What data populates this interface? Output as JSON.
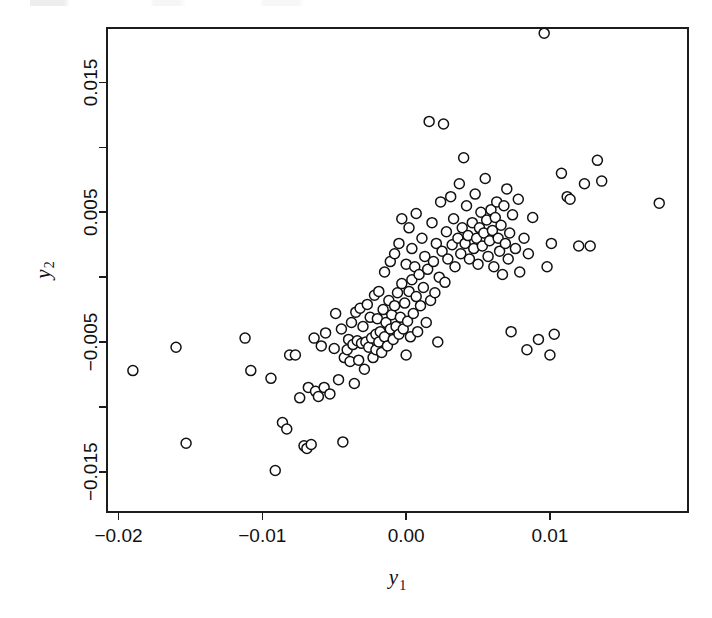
{
  "figure": {
    "background": "#ffffff",
    "ink_color": "#111111",
    "marker": {
      "shape": "open-circle",
      "radius_px": 5.0,
      "stroke": "#111111",
      "fill": "#ffffff",
      "stroke_width": 1.5
    },
    "plot_box": {
      "left": 107,
      "top": 28,
      "right": 688,
      "bottom": 512
    }
  },
  "chart_data": {
    "type": "scatter",
    "title": "",
    "xlabel": "y1",
    "ylabel": "y2",
    "xlabel_base": "y",
    "xlabel_sub": "1",
    "ylabel_base": "y",
    "ylabel_sub": "2",
    "grid": false,
    "legend": null,
    "box_frame": true,
    "xlim": [
      -0.0208,
      0.0196
    ],
    "ylim": [
      -0.0181,
      0.0192
    ],
    "xticks": [
      -0.02,
      -0.01,
      0.0,
      0.01
    ],
    "xticklabels": [
      "-0.02",
      "-0.01",
      "0.00",
      "0.01"
    ],
    "xminorticks": [],
    "yticks": [
      0.015,
      0.01,
      0.005,
      0.0,
      -0.005,
      -0.01,
      -0.015
    ],
    "yticklabels": [
      "0.015",
      "",
      "0.005",
      "",
      "-0.005",
      "",
      "-0.015"
    ],
    "ytick_labeled": [
      0.015,
      0.005,
      -0.005,
      -0.015
    ],
    "n_points": 136,
    "correlation_note": "positive association, dense diagonal cluster near origin",
    "points": [
      [
        -0.019,
        -0.0072
      ],
      [
        -0.016,
        -0.0054
      ],
      [
        -0.0153,
        -0.0128
      ],
      [
        -0.0112,
        -0.0047
      ],
      [
        -0.0108,
        -0.0072
      ],
      [
        -0.0094,
        -0.0078
      ],
      [
        -0.0091,
        -0.0149
      ],
      [
        -0.0086,
        -0.0112
      ],
      [
        -0.0083,
        -0.0117
      ],
      [
        -0.0081,
        -0.006
      ],
      [
        -0.0077,
        -0.006
      ],
      [
        -0.0074,
        -0.0093
      ],
      [
        -0.0071,
        -0.013
      ],
      [
        -0.0069,
        -0.0132
      ],
      [
        -0.0068,
        -0.0085
      ],
      [
        -0.0066,
        -0.0129
      ],
      [
        -0.0064,
        -0.0047
      ],
      [
        -0.0063,
        -0.0088
      ],
      [
        -0.0061,
        -0.0092
      ],
      [
        -0.0059,
        -0.0053
      ],
      [
        -0.0057,
        -0.0085
      ],
      [
        -0.0056,
        -0.0043
      ],
      [
        -0.0053,
        -0.009
      ],
      [
        -0.005,
        -0.0055
      ],
      [
        -0.0049,
        -0.0028
      ],
      [
        -0.0047,
        -0.0079
      ],
      [
        -0.0045,
        -0.004
      ],
      [
        -0.0044,
        -0.0127
      ],
      [
        -0.0043,
        -0.0062
      ],
      [
        -0.0041,
        -0.0056
      ],
      [
        -0.004,
        -0.0048
      ],
      [
        -0.0039,
        -0.0065
      ],
      [
        -0.0038,
        -0.0035
      ],
      [
        -0.0037,
        -0.0052
      ],
      [
        -0.0036,
        -0.0082
      ],
      [
        -0.0035,
        -0.0027
      ],
      [
        -0.0034,
        -0.0049
      ],
      [
        -0.0033,
        -0.0064
      ],
      [
        -0.0032,
        -0.0024
      ],
      [
        -0.0031,
        -0.0051
      ],
      [
        -0.003,
        -0.0038
      ],
      [
        -0.0029,
        -0.0071
      ],
      [
        -0.0028,
        -0.005
      ],
      [
        -0.0027,
        -0.0021
      ],
      [
        -0.0026,
        -0.0054
      ],
      [
        -0.0025,
        -0.0031
      ],
      [
        -0.0024,
        -0.0047
      ],
      [
        -0.0023,
        -0.0062
      ],
      [
        -0.0022,
        -0.0014
      ],
      [
        -0.0021,
        -0.0044
      ],
      [
        -0.0021,
        -0.0056
      ],
      [
        -0.002,
        -0.0032
      ],
      [
        -0.0019,
        -0.005
      ],
      [
        -0.0019,
        -0.0011
      ],
      [
        -0.0018,
        -0.0042
      ],
      [
        -0.0017,
        -0.0058
      ],
      [
        -0.0016,
        -0.0025
      ],
      [
        -0.0015,
        -0.0046
      ],
      [
        -0.0015,
        0.0004
      ],
      [
        -0.0014,
        -0.0035
      ],
      [
        -0.0013,
        -0.0053
      ],
      [
        -0.0012,
        -0.0018
      ],
      [
        -0.0011,
        -0.004
      ],
      [
        -0.0011,
        0.0012
      ],
      [
        -0.001,
        -0.0029
      ],
      [
        -0.0009,
        -0.0048
      ],
      [
        -0.0008,
        -0.0022
      ],
      [
        -0.0008,
        0.0018
      ],
      [
        -0.0007,
        -0.0038
      ],
      [
        -0.0006,
        -0.0012
      ],
      [
        -0.0005,
        -0.0044
      ],
      [
        -0.0005,
        0.0026
      ],
      [
        -0.0004,
        -0.0031
      ],
      [
        -0.0003,
        -0.0005
      ],
      [
        -0.0003,
        0.0045
      ],
      [
        -0.0002,
        -0.004
      ],
      [
        -0.0001,
        -0.002
      ],
      [
        0.0,
        -0.006
      ],
      [
        0.0,
        0.001
      ],
      [
        0.0001,
        -0.0034
      ],
      [
        0.0002,
        -0.0011
      ],
      [
        0.0002,
        0.0038
      ],
      [
        0.0003,
        -0.0046
      ],
      [
        0.0004,
        -0.0002
      ],
      [
        0.0004,
        0.0022
      ],
      [
        0.0005,
        -0.0028
      ],
      [
        0.0006,
        0.0008
      ],
      [
        0.0007,
        -0.0015
      ],
      [
        0.0007,
        0.0049
      ],
      [
        0.0008,
        -0.0042
      ],
      [
        0.0009,
        0.0002
      ],
      [
        0.001,
        -0.0022
      ],
      [
        0.0011,
        0.003
      ],
      [
        0.0012,
        -0.0008
      ],
      [
        0.0013,
        0.0016
      ],
      [
        0.0014,
        -0.0035
      ],
      [
        0.0015,
        0.0006
      ],
      [
        0.0016,
        0.012
      ],
      [
        0.0017,
        -0.0018
      ],
      [
        0.0018,
        0.0042
      ],
      [
        0.0019,
        0.0012
      ],
      [
        0.002,
        -0.0012
      ],
      [
        0.0021,
        0.0026
      ],
      [
        0.0022,
        -0.005
      ],
      [
        0.0023,
        0.0
      ],
      [
        0.0024,
        0.0058
      ],
      [
        0.0025,
        0.002
      ],
      [
        0.0026,
        0.0118
      ],
      [
        0.0027,
        -0.0004
      ],
      [
        0.0028,
        0.0035
      ],
      [
        0.0029,
        0.0014
      ],
      [
        0.0031,
        0.0062
      ],
      [
        0.0032,
        0.0025
      ],
      [
        0.0033,
        0.0045
      ],
      [
        0.0034,
        0.0008
      ],
      [
        0.0036,
        0.003
      ],
      [
        0.0037,
        0.0072
      ],
      [
        0.0038,
        0.0018
      ],
      [
        0.0039,
        0.0038
      ],
      [
        0.004,
        0.0092
      ],
      [
        0.0041,
        0.0026
      ],
      [
        0.0042,
        0.0055
      ],
      [
        0.0043,
        0.0032
      ],
      [
        0.0044,
        0.0014
      ],
      [
        0.0046,
        0.0042
      ],
      [
        0.0047,
        0.0022
      ],
      [
        0.0048,
        0.0064
      ],
      [
        0.0049,
        0.003
      ],
      [
        0.005,
        0.001
      ],
      [
        0.0051,
        0.0038
      ],
      [
        0.0052,
        0.005
      ],
      [
        0.0053,
        0.0024
      ],
      [
        0.0054,
        0.0034
      ],
      [
        0.0055,
        0.0076
      ],
      [
        0.0056,
        0.0044
      ],
      [
        0.0057,
        0.0016
      ],
      [
        0.0058,
        0.0028
      ],
      [
        0.0059,
        0.0052
      ],
      [
        0.006,
        0.0036
      ],
      [
        0.0061,
        0.0008
      ],
      [
        0.0062,
        0.0046
      ],
      [
        0.0063,
        0.0058
      ],
      [
        0.0064,
        0.003
      ],
      [
        0.0065,
        0.002
      ],
      [
        0.0066,
        0.004
      ],
      [
        0.0067,
        0.0002
      ],
      [
        0.0068,
        0.0055
      ],
      [
        0.0069,
        0.0026
      ],
      [
        0.007,
        0.0068
      ],
      [
        0.0071,
        0.0014
      ],
      [
        0.0072,
        0.0034
      ],
      [
        0.0073,
        -0.0042
      ],
      [
        0.0074,
        0.0048
      ],
      [
        0.0076,
        0.0022
      ],
      [
        0.0078,
        0.006
      ],
      [
        0.0079,
        0.0004
      ],
      [
        0.0082,
        0.003
      ],
      [
        0.0084,
        -0.0056
      ],
      [
        0.0085,
        0.0018
      ],
      [
        0.0088,
        0.0046
      ],
      [
        0.0092,
        -0.0048
      ],
      [
        0.0096,
        0.0188
      ],
      [
        0.0098,
        0.0008
      ],
      [
        0.01,
        -0.006
      ],
      [
        0.0101,
        0.0026
      ],
      [
        0.0103,
        -0.0044
      ],
      [
        0.0108,
        0.008
      ],
      [
        0.0112,
        0.0062
      ],
      [
        0.0114,
        0.006
      ],
      [
        0.012,
        0.0024
      ],
      [
        0.0124,
        0.0072
      ],
      [
        0.0128,
        0.0024
      ],
      [
        0.0133,
        0.009
      ],
      [
        0.0136,
        0.0074
      ],
      [
        0.0176,
        0.0057
      ]
    ]
  }
}
